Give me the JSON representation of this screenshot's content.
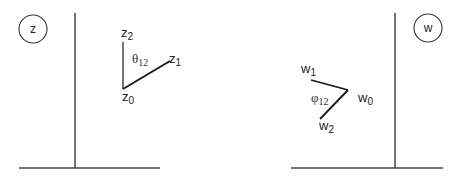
{
  "left_plane": {
    "badge": "z",
    "points": {
      "vertex": {
        "base": "z",
        "sub": "0"
      },
      "p1": {
        "base": "z",
        "sub": "1"
      },
      "p2": {
        "base": "z",
        "sub": "2"
      }
    },
    "angle": {
      "symbol": "θ",
      "sub": "12"
    }
  },
  "right_plane": {
    "badge": "w",
    "points": {
      "vertex": {
        "base": "w",
        "sub": "0"
      },
      "p1": {
        "base": "w",
        "sub": "1"
      },
      "p2": {
        "base": "w",
        "sub": "2"
      }
    },
    "angle": {
      "symbol": "φ",
      "sub": "12"
    }
  },
  "colors": {
    "line": "#2a2a2a",
    "text": "#222222",
    "background": "#ffffff"
  }
}
